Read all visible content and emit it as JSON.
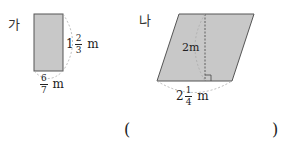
{
  "figures": {
    "ga": {
      "label": "가",
      "shape": "rectangle",
      "height": {
        "whole": "1",
        "num": "2",
        "den": "3",
        "unit": "m"
      },
      "width": {
        "whole": "",
        "num": "6",
        "den": "7",
        "unit": "m"
      }
    },
    "na": {
      "label": "나",
      "shape": "parallelogram",
      "height": {
        "value": "2",
        "unit": "m"
      },
      "base": {
        "whole": "2",
        "num": "1",
        "den": "4",
        "unit": "m"
      }
    }
  },
  "answer": {
    "open": "(",
    "close": ")"
  },
  "colors": {
    "fill": "#c8c8c8",
    "stroke": "#555555",
    "dash": "#999999"
  }
}
